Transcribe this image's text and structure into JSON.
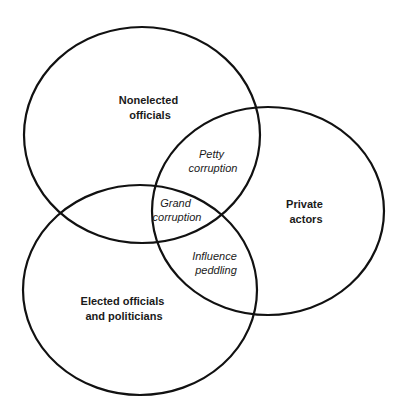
{
  "diagram": {
    "type": "venn",
    "stroke_color": "#111111",
    "sets": [
      {
        "id": "nonelected",
        "label_lines": [
          "Nonelected",
          "officials"
        ]
      },
      {
        "id": "private",
        "label_lines": [
          "Private",
          "actors"
        ]
      },
      {
        "id": "elected",
        "label_lines": [
          "Elected officials",
          "and politicians"
        ]
      }
    ],
    "intersections": [
      {
        "between": [
          "nonelected",
          "private"
        ],
        "label_lines": [
          "Petty",
          "corruption"
        ]
      },
      {
        "between": [
          "nonelected",
          "private",
          "elected"
        ],
        "label_lines": [
          "Grand",
          "corruption"
        ]
      },
      {
        "between": [
          "elected",
          "private"
        ],
        "label_lines": [
          "Influence",
          "peddling"
        ]
      }
    ]
  }
}
